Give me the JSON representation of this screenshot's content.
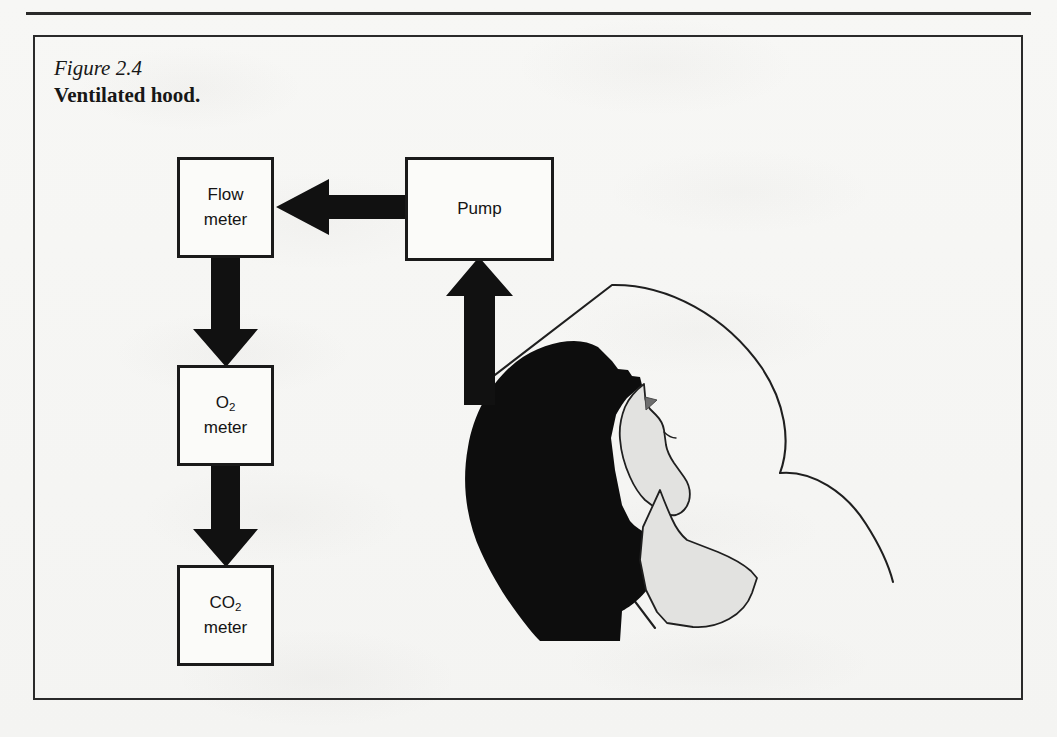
{
  "page": {
    "background_color": "#f7f7f5",
    "ink_color": "#1a1a1a",
    "running_head": "",
    "folio": ""
  },
  "caption": {
    "figure_number": "Figure 2.4",
    "figure_title": "Ventilated hood."
  },
  "diagram": {
    "boxes": [
      {
        "id": "flow-meter",
        "line1": "Flow",
        "line2": "meter",
        "x": 177,
        "y": 157,
        "w": 97,
        "h": 101
      },
      {
        "id": "pump",
        "line1": "Pump",
        "line2": "",
        "x": 405,
        "y": 157,
        "w": 149,
        "h": 104
      },
      {
        "id": "o2-meter",
        "line1": "O",
        "sub1": "2",
        "line2": "meter",
        "x": 177,
        "y": 365,
        "w": 97,
        "h": 101
      },
      {
        "id": "co2-meter",
        "line1": "CO",
        "sub1": "2",
        "line2": "meter",
        "x": 177,
        "y": 565,
        "w": 97,
        "h": 101
      }
    ],
    "arrows": [
      {
        "id": "pump-to-flow-meter",
        "direction": "left",
        "from": "pump",
        "to": "flow-meter"
      },
      {
        "id": "flow-meter-to-o2-meter",
        "direction": "down",
        "from": "flow-meter",
        "to": "o2-meter"
      },
      {
        "id": "o2-meter-to-co2-meter",
        "direction": "down",
        "from": "o2-meter",
        "to": "co2-meter"
      },
      {
        "id": "hood-to-pump",
        "direction": "up",
        "from": "ventilated-hood",
        "to": "pump"
      }
    ],
    "illustration": {
      "id": "ventilated-hood-over-subject",
      "hood_fill": "none",
      "hood_stroke": "#1f1f1f",
      "hair_fill": "#0d0d0d",
      "skin_fill": "#e2e2e0",
      "eye_fill": "#6e6e6e"
    }
  }
}
